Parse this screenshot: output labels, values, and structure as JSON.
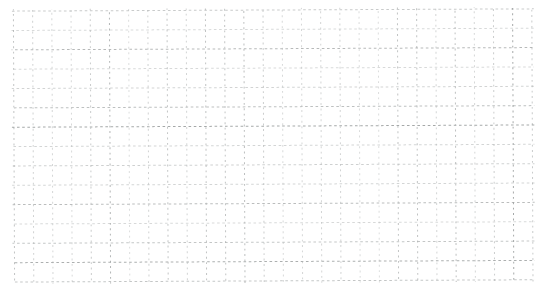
{
  "page": {
    "background_color": "#ffffff",
    "content": "blank dashed grid paper, no text"
  },
  "grid": {
    "columns": 27,
    "rows": 14,
    "cell_width": 19.2,
    "cell_height": 19.35,
    "origin_x": 14,
    "origin_y": 10,
    "line_color": "#b3b6b6",
    "line_color_dark": "#949898",
    "line_width": 1,
    "horizontal_dash": "2.6 2.6",
    "vertical_dash": "1.9 3.5",
    "rotation_deg": -0.25,
    "min_opacity": 0.45,
    "max_opacity": 0.9
  }
}
